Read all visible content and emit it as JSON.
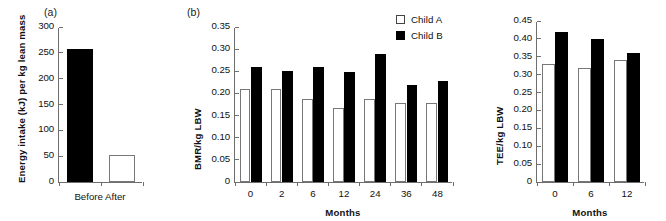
{
  "figure": {
    "background": "#ffffff",
    "filled_color": "#000000",
    "open_color": "#ffffff",
    "axis_color": "#6e6e6e"
  },
  "legend": {
    "entries": [
      {
        "label": "Child A",
        "style": "open"
      },
      {
        "label": "Child B",
        "style": "filled"
      }
    ]
  },
  "panels": {
    "a": {
      "tag": "(a)",
      "xlabel": "Before After"
    },
    "b": {
      "tag": "(b)",
      "xlabel": "Months"
    },
    "c": {
      "tag": "",
      "xlabel": "Months"
    }
  },
  "chart_data": [
    {
      "type": "bar",
      "panel": "(a)",
      "title": "",
      "xlabel": "Before After",
      "ylabel": "Energy intake (kJ) per kg lean mass",
      "categories": [
        "Before",
        "After"
      ],
      "values": [
        257,
        53
      ],
      "styles": [
        "filled",
        "open"
      ],
      "ylim": [
        0,
        300
      ],
      "yticks": [
        0,
        50,
        100,
        150,
        200,
        250,
        300
      ],
      "ytick_labels": [
        "0",
        "50",
        "100",
        "150",
        "200",
        "250",
        "300"
      ],
      "grid": false,
      "legend": "none"
    },
    {
      "type": "bar",
      "panel": "(b)",
      "title": "",
      "xlabel": "Months",
      "ylabel": "BMR/kg LBW",
      "categories": [
        "0",
        "2",
        "6",
        "12",
        "24",
        "36",
        "48"
      ],
      "series": [
        {
          "name": "Child A",
          "style": "open",
          "values": [
            0.21,
            0.21,
            0.188,
            0.168,
            0.188,
            0.179,
            0.178
          ]
        },
        {
          "name": "Child B",
          "style": "filled",
          "values": [
            0.26,
            0.25,
            0.26,
            0.249,
            0.29,
            0.218,
            0.229
          ]
        }
      ],
      "ylim": [
        0,
        0.35
      ],
      "yticks": [
        0,
        0.05,
        0.1,
        0.15,
        0.2,
        0.25,
        0.3,
        0.35
      ],
      "ytick_labels": [
        "0",
        "0.05",
        "0.10",
        "0.15",
        "0.20",
        "0.25",
        "0.30",
        "0.35"
      ],
      "grid": false,
      "legend": "top-right"
    },
    {
      "type": "bar",
      "panel": "(c)",
      "title": "",
      "xlabel": "Months",
      "ylabel": "TEE/kg LBW",
      "categories": [
        "0",
        "6",
        "12"
      ],
      "series": [
        {
          "name": "Child A",
          "style": "open",
          "values": [
            0.33,
            0.32,
            0.34
          ]
        },
        {
          "name": "Child B",
          "style": "filled",
          "values": [
            0.42,
            0.4,
            0.36
          ]
        }
      ],
      "ylim": [
        0,
        0.45
      ],
      "yticks": [
        0,
        0.05,
        0.1,
        0.15,
        0.2,
        0.25,
        0.3,
        0.35,
        0.4,
        0.45
      ],
      "ytick_labels": [
        "0",
        "0.05",
        "0.10",
        "0.15",
        "0.20",
        "0.25",
        "0.30",
        "0.35",
        "0.40",
        "0.45"
      ],
      "grid": false,
      "legend": "none"
    }
  ]
}
